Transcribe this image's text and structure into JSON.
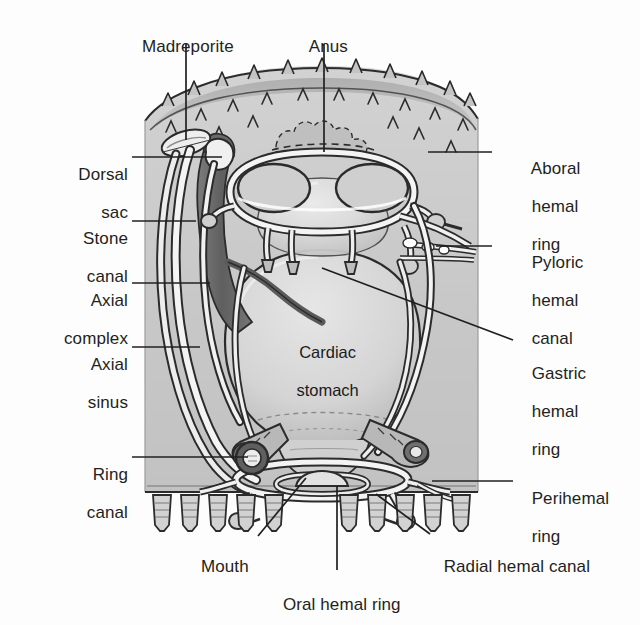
{
  "figure": {
    "organism": "asteroid echinoderm",
    "view": "vertical section"
  },
  "colors": {
    "page_background": "#fdfdfd",
    "body_wall_fill": "#c9c9c9",
    "body_wall_light": "#d5d5d5",
    "aboral_dome": "#b0b0b0",
    "stomach_fill": "#d9d9d9",
    "stomach_highlight": "#e8e8e8",
    "axial_complex_dark": "#6e6e6e",
    "vessel_outline": "#2b2b2b",
    "vessel_fill": "#f2f2f2",
    "leader_line": "#231f20",
    "text": "#231f20"
  },
  "labels_left": [
    {
      "id": "dorsal-sac",
      "line1": "Dorsal",
      "line2": "sac",
      "x": 48,
      "y": 146,
      "leader": {
        "x1": 132,
        "y1": 157,
        "x2": 222,
        "y2": 157
      }
    },
    {
      "id": "stone-canal",
      "line1": "Stone",
      "line2": "canal",
      "x": 48,
      "y": 210,
      "leader": {
        "x1": 132,
        "y1": 221,
        "x2": 196,
        "y2": 221
      }
    },
    {
      "id": "axial-complex",
      "line1": "Axial",
      "line2": "complex",
      "x": 30,
      "y": 272,
      "leader": {
        "x1": 132,
        "y1": 283,
        "x2": 208,
        "y2": 283
      }
    },
    {
      "id": "axial-sinus",
      "line1": "Axial",
      "line2": "sinus",
      "x": 48,
      "y": 336,
      "leader": {
        "x1": 132,
        "y1": 347,
        "x2": 200,
        "y2": 347
      }
    },
    {
      "id": "ring-canal",
      "line1": "Ring",
      "line2": "canal",
      "x": 60,
      "y": 446,
      "leader": {
        "x1": 132,
        "y1": 457,
        "x2": 248,
        "y2": 457
      }
    }
  ],
  "labels_right": [
    {
      "id": "aboral-hemal-ring",
      "line1": "Aboral",
      "line2": "hemal",
      "line3": "ring",
      "x": 522,
      "y": 140,
      "leader": {
        "x1": 492,
        "y1": 152,
        "x2": 430,
        "y2": 152
      }
    },
    {
      "id": "pyloric-hemal-canal",
      "line1": "Pyloric",
      "line2": "hemal",
      "line3": "canal",
      "x": 522,
      "y": 234,
      "leader": {
        "x1": 492,
        "y1": 246,
        "x2": 436,
        "y2": 246
      }
    },
    {
      "id": "gastric-hemal-ring",
      "line1": "Gastric",
      "line2": "hemal",
      "line3": "ring",
      "x": 522,
      "y": 345,
      "leader": {
        "x1": 513,
        "y1": 340,
        "x2": 322,
        "y2": 268
      }
    },
    {
      "id": "perihemal-ring",
      "line1": "Perihemal",
      "line2": "ring",
      "line3": "",
      "x": 522,
      "y": 470,
      "leader": {
        "x1": 513,
        "y1": 481,
        "x2": 432,
        "y2": 481
      }
    }
  ],
  "labels_bottom": [
    {
      "id": "mouth",
      "text": "Mouth",
      "x": 195,
      "y": 540,
      "leader": {
        "x1": 258,
        "y1": 538,
        "x2": 300,
        "y2": 480
      }
    },
    {
      "id": "oral-hemal-ring",
      "text": "Oral hemal ring",
      "x": 272,
      "y": 578,
      "leader": {
        "x1": 337,
        "y1": 572,
        "x2": 337,
        "y2": 485
      }
    },
    {
      "id": "radial-hemal-canal",
      "text": "Radial hemal canal",
      "x": 432,
      "y": 540,
      "leader": {
        "x1": 428,
        "y1": 536,
        "x2": 372,
        "y2": 492
      }
    }
  ],
  "labels_top": [
    {
      "id": "madreporite",
      "text": "Madreporite",
      "x": 130,
      "y": 18,
      "leader": {
        "x1": 186,
        "y1": 44,
        "x2": 186,
        "y2": 140
      }
    },
    {
      "id": "anus",
      "text": "Anus",
      "x": 300,
      "y": 18,
      "leader": {
        "x1": 324,
        "y1": 44,
        "x2": 324,
        "y2": 150
      }
    }
  ],
  "internal_labels": [
    {
      "id": "cardiac-stomach",
      "line1": "Cardiac",
      "line2": "stomach",
      "x": 272,
      "y": 325
    }
  ],
  "structures": {
    "tube_feet_left_count": 5,
    "tube_feet_right_count": 5,
    "spine_count_aboral": 18
  }
}
